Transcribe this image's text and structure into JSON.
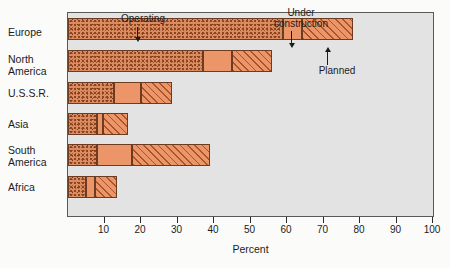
{
  "chart_data": {
    "type": "bar",
    "orientation": "horizontal",
    "stacked": true,
    "title": "",
    "xlabel": "Percent",
    "ylabel": "",
    "xlim": [
      0,
      100
    ],
    "xticks": [
      0,
      10,
      20,
      30,
      40,
      50,
      60,
      70,
      80,
      90,
      100
    ],
    "xticklabels": [
      "",
      "10",
      "20",
      "30",
      "40",
      "50",
      "60",
      "70",
      "80",
      "90",
      "100"
    ],
    "grid": false,
    "legend": "annotations",
    "categories": [
      "Europe",
      "North America",
      "U.S.S.R.",
      "Asia",
      "South America",
      "Africa"
    ],
    "series": [
      {
        "name": "Operating",
        "values": [
          59.0,
          37.0,
          12.5,
          8.0,
          8.0,
          5.0
        ]
      },
      {
        "name": "Under construction",
        "values": [
          5.0,
          8.0,
          7.5,
          1.5,
          9.5,
          2.5
        ]
      },
      {
        "name": "Planned",
        "values": [
          14.0,
          11.0,
          8.5,
          7.0,
          21.5,
          6.0
        ]
      }
    ],
    "totals": [
      78.0,
      56.0,
      28.5,
      16.5,
      39.0,
      13.5
    ],
    "annotations": [
      {
        "text": "Operating",
        "points_to": "operating-segment"
      },
      {
        "text": "Under\nconstruction",
        "points_to": "construction-segment"
      },
      {
        "text": "Planned",
        "points_to": "planned-segment"
      }
    ]
  },
  "axis": {
    "x_title": "Percent",
    "tick_labels": [
      "10",
      "20",
      "30",
      "40",
      "50",
      "60",
      "70",
      "80",
      "90",
      "100"
    ]
  },
  "categories": {
    "europe": "Europe",
    "north_america": "North\nAmerica",
    "ussr": "U.S.S.R.",
    "asia": "Asia",
    "south_america": "South\nAmerica",
    "africa": "Africa"
  },
  "annotations": {
    "operating": "Operating",
    "under_construction": "Under\nconstruction",
    "planned": "Planned"
  },
  "colors": {
    "plot_background": "#e3e3e3",
    "plot_border": "#5a5a5a",
    "operating_fill": "#d98b62",
    "operating_speckle": "#8f4420",
    "construction_fill": "#eb9569",
    "planned_fill": "#eb9569",
    "planned_hatch": "#a9552b",
    "segment_outline": "#6b3b22",
    "text": "#1c1c1c"
  }
}
